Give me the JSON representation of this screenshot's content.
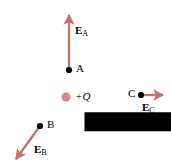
{
  "figure": {
    "width": 171,
    "height": 167,
    "background_color": "#ffffff",
    "arrow_color": "#c0756c",
    "charge_color": "#e2827f",
    "point_color": "#000000",
    "label_color": "#000000"
  },
  "charge": {
    "label_sign": "+",
    "label_symbol": "Q",
    "label": "+Q",
    "x": 66,
    "y": 97,
    "radius": 4.5,
    "color": "#e2827f"
  },
  "points": [
    {
      "id": "A",
      "label": "A",
      "x": 69,
      "y": 70,
      "label_x": 75,
      "label_y": 64
    },
    {
      "id": "B",
      "label": "B",
      "x": 40,
      "y": 126,
      "label_x": 46,
      "label_y": 120
    },
    {
      "id": "C",
      "label": "C",
      "x": 141,
      "y": 95,
      "label_x": 129,
      "label_y": 89
    }
  ],
  "vectors": [
    {
      "id": "E_A",
      "symbol": "E",
      "subscript": "A",
      "from_point": "A",
      "x1": 69,
      "y1": 70,
      "x2": 69,
      "y2": 11,
      "direction": "up",
      "label_x": 75,
      "label_y": 25
    },
    {
      "id": "E_B",
      "symbol": "E",
      "subscript": "B",
      "from_point": "B",
      "x1": 40,
      "y1": 126,
      "x2": 13,
      "y2": 163,
      "direction": "down-left",
      "label_x": 34,
      "label_y": 144
    },
    {
      "id": "E_C",
      "symbol": "E",
      "subscript": "C",
      "from_point": "C",
      "x1": 141,
      "y1": 95,
      "x2": 168,
      "y2": 95,
      "direction": "right",
      "label_x": 142,
      "label_y": 102
    }
  ]
}
